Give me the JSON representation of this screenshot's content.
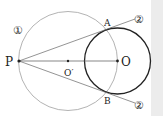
{
  "labels": {
    "P": "P",
    "O": "O",
    "O_prime": "O′",
    "A": "A",
    "B": "B",
    "circle1": "①",
    "line_upper": "②",
    "line_lower": "②"
  },
  "colors": {
    "thin": "#9a9a9a",
    "thick": "#222222",
    "text": "#222222",
    "strip": "#ececec"
  }
}
